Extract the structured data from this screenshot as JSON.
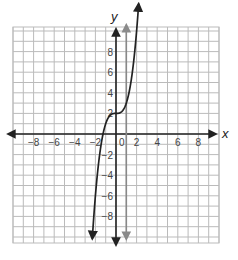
{
  "chart_data": {
    "type": "line",
    "title": "",
    "xlabel": "x",
    "ylabel": "y",
    "xlim": [
      -10,
      10
    ],
    "ylim": [
      -10.5,
      10.5
    ],
    "grid": true,
    "x_tick_labels": [
      "-8",
      "-6",
      "-4",
      "-2",
      "0",
      "2",
      "4",
      "6",
      "8"
    ],
    "y_tick_labels": [
      "8",
      "6",
      "4",
      "2",
      "-2",
      "-4",
      "-6",
      "-8"
    ],
    "series": [
      {
        "name": "curve",
        "description": "cubic-shaped curve with arrows at both ends, y ≈ x^3 + 2",
        "color": "#222222",
        "x": [
          -2.3,
          -2,
          -1.5,
          -1.26,
          -1,
          -0.5,
          0,
          0.5,
          1,
          1.5,
          2,
          2.2
        ],
        "y": [
          -10.2,
          -6,
          -1.4,
          0,
          1,
          1.9,
          2,
          2.1,
          3,
          5.4,
          10,
          10.6
        ]
      },
      {
        "name": "vertical-line",
        "description": "gray vertical line with arrows at both ends",
        "color": "#888888",
        "x": [
          1,
          1
        ],
        "y": [
          -10.2,
          10.6
        ]
      }
    ],
    "colors": {
      "grid": "#bbbbbb",
      "axes": "#222222",
      "curve": "#222222",
      "vertical_line": "#8a8a8a"
    }
  }
}
